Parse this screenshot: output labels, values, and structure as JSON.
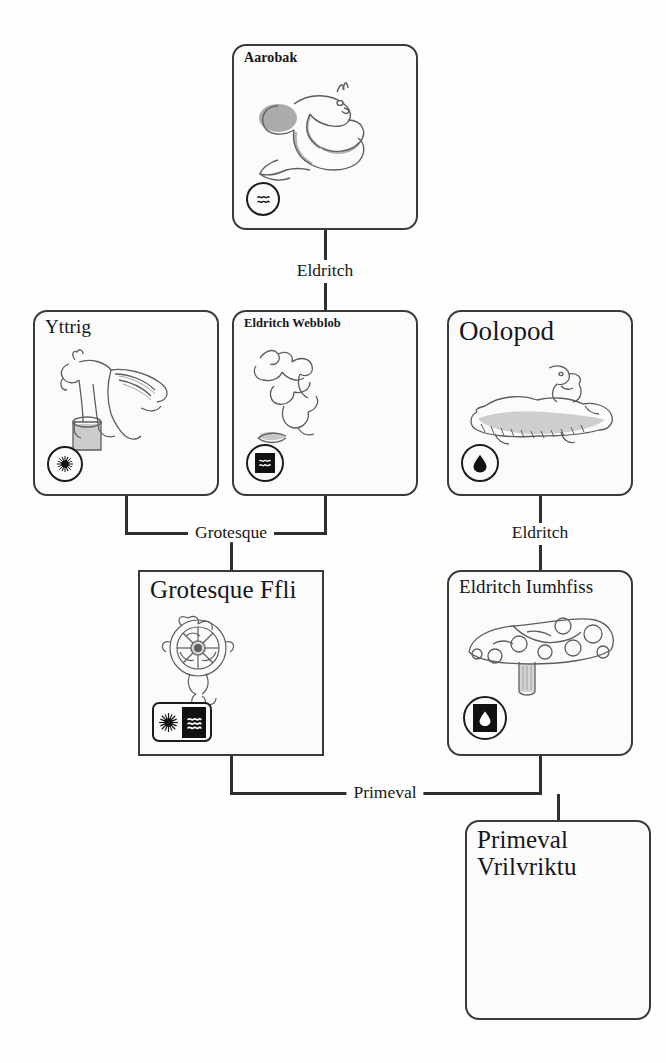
{
  "diagram": {
    "type": "creature-evolution-tree",
    "title": "",
    "canvas": {
      "width": 666,
      "height": 1063
    },
    "background_color": "#fefefe",
    "ink_color": "#2f2f2f"
  },
  "cards": [
    {
      "id": "aarobak",
      "name": "Aarobak",
      "title_size": "t-sm",
      "corner": "rounded",
      "x": 232,
      "y": 44,
      "w": 186,
      "h": 186,
      "art": "serpent-eel",
      "badges": [
        {
          "shape": "circle",
          "glyph": "wave",
          "inverted": false
        }
      ]
    },
    {
      "id": "yttrig",
      "name": "Yttrig",
      "title_size": "t-md",
      "corner": "rounded",
      "x": 33,
      "y": 310,
      "w": 186,
      "h": 186,
      "art": "winged-beast-pedestal",
      "badges": [
        {
          "shape": "circle",
          "glyph": "sun",
          "inverted": false
        }
      ]
    },
    {
      "id": "eldritch-webblob",
      "name": "Eldritch Webblob",
      "title_size": "t-xs",
      "corner": "rounded",
      "x": 232,
      "y": 310,
      "w": 186,
      "h": 186,
      "art": "webblob-tendrils",
      "badges": [
        {
          "shape": "circle",
          "glyph": "wave",
          "inverted": true
        }
      ]
    },
    {
      "id": "oolopod",
      "name": "Oolopod",
      "title_size": "t-xl",
      "corner": "rounded",
      "x": 447,
      "y": 310,
      "w": 186,
      "h": 186,
      "art": "oolopod-creature",
      "badges": [
        {
          "shape": "circle",
          "glyph": "drop",
          "inverted": false
        }
      ]
    },
    {
      "id": "grotesque-ffli",
      "name": "Grotesque Ffli",
      "title_size": "t-lg",
      "corner": "square",
      "x": 138,
      "y": 570,
      "w": 186,
      "h": 186,
      "art": "grotesque-wheel",
      "badges": [
        {
          "shape": "rect",
          "glyph": "sun",
          "inverted": false,
          "glyph2": "wave",
          "inverted2": true
        }
      ]
    },
    {
      "id": "eldritch-iumhfiss",
      "name": "Eldritch Iumhfiss",
      "title_size": "t-md",
      "corner": "rounded",
      "x": 447,
      "y": 570,
      "w": 186,
      "h": 186,
      "art": "spotted-mushroom",
      "badges": [
        {
          "shape": "circle",
          "glyph": "drop",
          "inverted": true
        }
      ]
    },
    {
      "id": "primeval-vrilvriktu",
      "name": "Primeval\nVrilvriktu",
      "title_size": "t-lg",
      "corner": "rounded",
      "x": 465,
      "y": 820,
      "w": 186,
      "h": 200,
      "art": "none",
      "badges": []
    }
  ],
  "edges": [
    {
      "id": "edge-eldritch-top",
      "label": "Eldritch",
      "from": "aarobak",
      "to": "eldritch-webblob",
      "label_x": 325,
      "label_y": 271
    },
    {
      "id": "edge-grotesque",
      "label": "Grotesque",
      "from": "yttrig+eldritch-webblob",
      "to": "grotesque-ffli",
      "label_x": 231,
      "label_y": 533
    },
    {
      "id": "edge-eldritch-right",
      "label": "Eldritch",
      "from": "oolopod",
      "to": "eldritch-iumhfiss",
      "label_x": 540,
      "label_y": 533
    },
    {
      "id": "edge-primeval",
      "label": "Primeval",
      "from": "grotesque-ffli+eldritch-iumhfiss",
      "to": "primeval-vrilvriktu",
      "label_x": 385,
      "label_y": 793
    }
  ],
  "glyph_names": {
    "wave": "wave-icon",
    "sun": "sun-icon",
    "drop": "water-drop-icon"
  }
}
